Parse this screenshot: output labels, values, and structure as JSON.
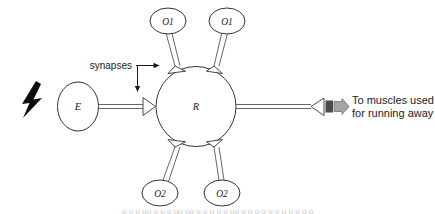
{
  "figure": {
    "title_visible": false,
    "background_color": "#ffffff",
    "stroke_color": "#333333",
    "line_color": "#555555",
    "text_color": "#1a1a1a",
    "stimulus_color": "#0d0d0d",
    "output_arrow_color": "#9a9a9a"
  },
  "nodes": {
    "receptor": {
      "label": "E",
      "shape": "ellipse"
    },
    "relay": {
      "label": "R",
      "shape": "circle"
    },
    "output_top_left": {
      "label": "O1",
      "shape": "ellipse"
    },
    "output_top_right": {
      "label": "O1",
      "shape": "ellipse"
    },
    "output_bottom_left": {
      "label": "O2",
      "shape": "ellipse"
    },
    "output_bottom_right": {
      "label": "O2",
      "shape": "ellipse"
    }
  },
  "annotations": {
    "synapses_label": "synapses",
    "muscles_line1": "To muscles used",
    "muscles_line2": "for running away"
  },
  "footer": {
    "partial_caption": "o o  o   oo   o  o o  oo  oo o o   o o  o  oo o o  o o o  o    o o   o  o o"
  }
}
